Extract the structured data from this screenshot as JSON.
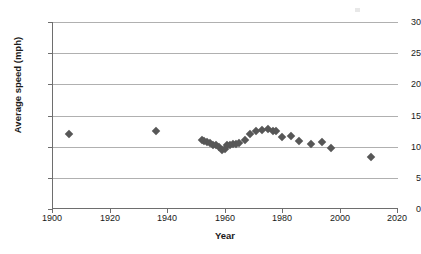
{
  "chart_data": {
    "type": "scatter",
    "title": "",
    "xlabel": "Year",
    "ylabel": "Average speed (mph)",
    "xlim": [
      1900,
      2020
    ],
    "ylim": [
      0,
      30
    ],
    "xticks": [
      1900,
      1920,
      1940,
      1960,
      1980,
      2000,
      2020
    ],
    "yticks": [
      0,
      5,
      10,
      15,
      20,
      25,
      30
    ],
    "grid": "horizontal",
    "legend": "none",
    "marker": "diamond",
    "marker_color": "#575757",
    "series": [
      {
        "name": "Average speed",
        "points": [
          {
            "x": 1906,
            "y": 12.1
          },
          {
            "x": 1936,
            "y": 12.5
          },
          {
            "x": 1952,
            "y": 11.0
          },
          {
            "x": 1953,
            "y": 10.9
          },
          {
            "x": 1954,
            "y": 10.7
          },
          {
            "x": 1955,
            "y": 10.6
          },
          {
            "x": 1956,
            "y": 10.3
          },
          {
            "x": 1957,
            "y": 10.2
          },
          {
            "x": 1958,
            "y": 10.0
          },
          {
            "x": 1959,
            "y": 9.5
          },
          {
            "x": 1960,
            "y": 9.6
          },
          {
            "x": 1961,
            "y": 10.2
          },
          {
            "x": 1962,
            "y": 10.3
          },
          {
            "x": 1963,
            "y": 10.4
          },
          {
            "x": 1964,
            "y": 10.5
          },
          {
            "x": 1965,
            "y": 10.6
          },
          {
            "x": 1967,
            "y": 11.0
          },
          {
            "x": 1969,
            "y": 12.0
          },
          {
            "x": 1971,
            "y": 12.5
          },
          {
            "x": 1973,
            "y": 12.7
          },
          {
            "x": 1975,
            "y": 12.8
          },
          {
            "x": 1977,
            "y": 12.5
          },
          {
            "x": 1978,
            "y": 12.5
          },
          {
            "x": 1980,
            "y": 11.5
          },
          {
            "x": 1983,
            "y": 11.7
          },
          {
            "x": 1986,
            "y": 10.9
          },
          {
            "x": 1990,
            "y": 10.4
          },
          {
            "x": 1994,
            "y": 10.7
          },
          {
            "x": 1997,
            "y": 9.8
          },
          {
            "x": 2011,
            "y": 8.3
          }
        ]
      }
    ]
  }
}
